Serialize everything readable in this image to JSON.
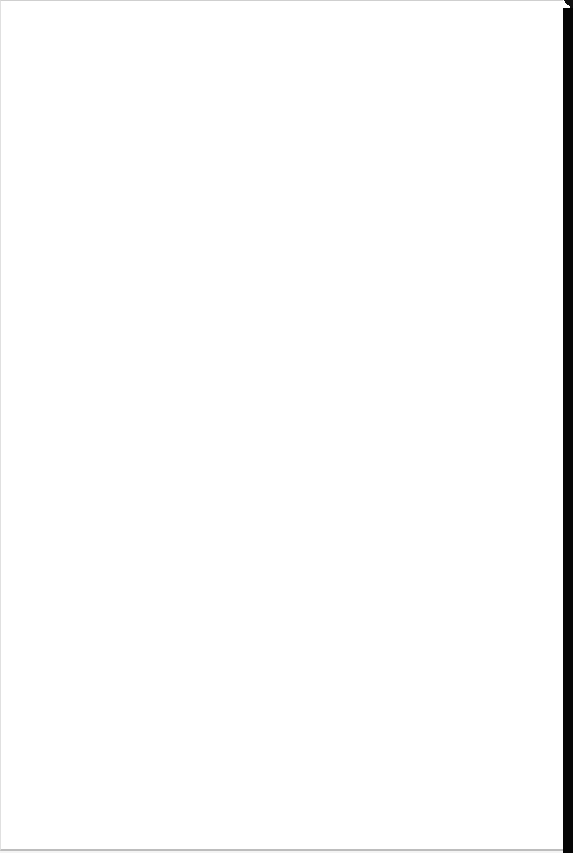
{
  "document": {
    "type": "scanned-page",
    "content": "",
    "colors": {
      "page": "#ffffff",
      "binding_edge": "#050505"
    }
  }
}
